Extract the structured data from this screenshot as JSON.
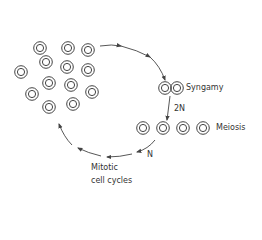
{
  "diagram": {
    "type": "life-cycle",
    "colors": {
      "stroke": "#444444",
      "text": "#333333",
      "background": "#ffffff"
    },
    "cell_cluster": {
      "cells": [
        {
          "x": 40,
          "y": 48
        },
        {
          "x": 68,
          "y": 48
        },
        {
          "x": 88,
          "y": 50
        },
        {
          "x": 46,
          "y": 62
        },
        {
          "x": 67,
          "y": 67
        },
        {
          "x": 88,
          "y": 70
        },
        {
          "x": 21,
          "y": 72
        },
        {
          "x": 49,
          "y": 83
        },
        {
          "x": 71,
          "y": 85
        },
        {
          "x": 92,
          "y": 92
        },
        {
          "x": 32,
          "y": 94
        },
        {
          "x": 49,
          "y": 107
        },
        {
          "x": 73,
          "y": 104
        }
      ]
    },
    "syngamy": {
      "label": "Syngamy",
      "cells": [
        {
          "x": 165,
          "y": 88
        },
        {
          "x": 177,
          "y": 88
        }
      ]
    },
    "ploidy_2n": {
      "label": "2N"
    },
    "meiosis": {
      "label": "Meiosis",
      "cells": [
        {
          "x": 143,
          "y": 128
        },
        {
          "x": 163,
          "y": 128
        },
        {
          "x": 183,
          "y": 128
        },
        {
          "x": 203,
          "y": 128
        }
      ]
    },
    "ploidy_n": {
      "label": "N"
    },
    "mitotic": {
      "label": "Mitotic\ncell cycles"
    }
  }
}
